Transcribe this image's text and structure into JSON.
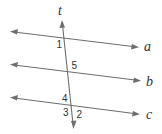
{
  "diagram": {
    "line_color": "#6e6e6e",
    "text_color": "#333333",
    "lines": [
      {
        "id": "a",
        "label": "a",
        "x1": 12,
        "y1": 32,
        "x2": 136,
        "y2": 47
      },
      {
        "id": "b",
        "label": "b",
        "x1": 12,
        "y1": 65,
        "x2": 138,
        "y2": 80
      },
      {
        "id": "c",
        "label": "c",
        "x1": 12,
        "y1": 98,
        "x2": 137,
        "y2": 114
      }
    ],
    "transversal": {
      "id": "t",
      "label": "t",
      "x1": 62,
      "y1": 22,
      "x2": 73,
      "y2": 127
    },
    "angle_labels": [
      {
        "label": "1"
      },
      {
        "label": "5"
      },
      {
        "label": "4"
      },
      {
        "label": "3"
      },
      {
        "label": "2"
      }
    ]
  }
}
